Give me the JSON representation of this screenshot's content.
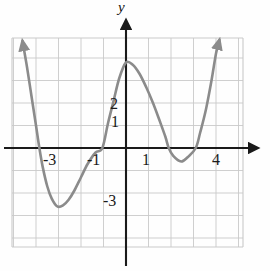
{
  "figure": {
    "title": "",
    "background": "#fefefe",
    "width": 270,
    "height": 271
  },
  "axes": {
    "y_axis_name": "y",
    "x_axis_name": "",
    "axis_color": "#1a1a1a",
    "grid_color": "#c9c9c9",
    "grid_visible": true,
    "x_axis_pixel_y": 148,
    "y_axis_pixel_x": 126,
    "unit_pixels": 22.5,
    "grid_bounds_px": {
      "left": 12,
      "top": 38,
      "right": 243,
      "bottom": 247
    },
    "xlim": [
      -5.1,
      5.2
    ],
    "ylim": [
      -4.9,
      4.9
    ],
    "x_tick_labels": [
      "-3",
      "-1",
      "1",
      "4"
    ],
    "x_tick_values": [
      -3,
      -1,
      1,
      4
    ],
    "y_tick_labels": [
      "2",
      "1",
      "-3"
    ],
    "y_tick_values": [
      2,
      1,
      -3
    ]
  },
  "chart_data": {
    "type": "line",
    "title": "",
    "xlabel": "",
    "ylabel": "y",
    "xlim": [
      -5.1,
      5.2
    ],
    "ylim": [
      -4.9,
      4.9
    ],
    "grid": true,
    "legend": "none",
    "series": [
      {
        "name": "quartic curve",
        "color": "#8b8b8b",
        "line_width": 2.6,
        "arrow_start": true,
        "arrow_end": true,
        "description": "W-shaped quartic with two minima and one local maximum",
        "features": {
          "local_maximum": {
            "x": 0.0,
            "y": 3.8
          },
          "local_minimum_left": {
            "x": -3.05,
            "y": -2.6
          },
          "local_minimum_right": {
            "x": 2.45,
            "y": -0.6
          },
          "x_intercepts": [
            -3.85,
            -1.05,
            1.9,
            3.1
          ],
          "y_intercept": 3.8
        },
        "points": [
          {
            "x": -4.6,
            "y": 4.75
          },
          {
            "x": -4.4,
            "y": 3.6
          },
          {
            "x": -4.2,
            "y": 2.3
          },
          {
            "x": -4.0,
            "y": 1.0
          },
          {
            "x": -3.85,
            "y": 0.0
          },
          {
            "x": -3.7,
            "y": -0.85
          },
          {
            "x": -3.5,
            "y": -1.7
          },
          {
            "x": -3.3,
            "y": -2.25
          },
          {
            "x": -3.05,
            "y": -2.6
          },
          {
            "x": -2.8,
            "y": -2.55
          },
          {
            "x": -2.55,
            "y": -2.3
          },
          {
            "x": -2.3,
            "y": -1.9
          },
          {
            "x": -2.0,
            "y": -1.3
          },
          {
            "x": -1.7,
            "y": -0.7
          },
          {
            "x": -1.35,
            "y": -0.2
          },
          {
            "x": -1.05,
            "y": 0.0
          },
          {
            "x": -0.8,
            "y": 1.1
          },
          {
            "x": -0.55,
            "y": 2.1
          },
          {
            "x": -0.3,
            "y": 3.1
          },
          {
            "x": 0.0,
            "y": 3.8
          },
          {
            "x": 0.3,
            "y": 3.7
          },
          {
            "x": 0.6,
            "y": 3.3
          },
          {
            "x": 0.9,
            "y": 2.7
          },
          {
            "x": 1.2,
            "y": 2.0
          },
          {
            "x": 1.5,
            "y": 1.2
          },
          {
            "x": 1.75,
            "y": 0.5
          },
          {
            "x": 1.9,
            "y": 0.0
          },
          {
            "x": 2.1,
            "y": -0.35
          },
          {
            "x": 2.45,
            "y": -0.6
          },
          {
            "x": 2.75,
            "y": -0.4
          },
          {
            "x": 3.1,
            "y": 0.0
          },
          {
            "x": 3.3,
            "y": 0.7
          },
          {
            "x": 3.55,
            "y": 1.7
          },
          {
            "x": 3.8,
            "y": 3.0
          },
          {
            "x": 4.0,
            "y": 4.2
          },
          {
            "x": 4.15,
            "y": 4.8
          }
        ]
      }
    ]
  }
}
